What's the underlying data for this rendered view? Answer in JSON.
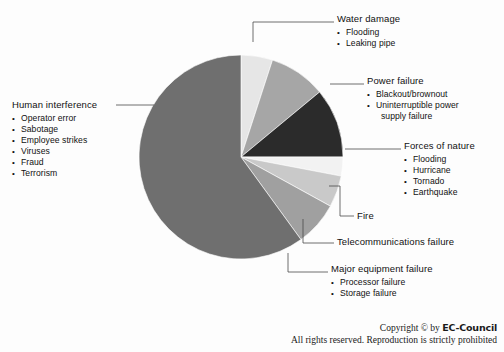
{
  "chart_data": {
    "type": "pie",
    "title": "",
    "legend_position": "callouts",
    "categories": [
      "Water damage",
      "Power failure",
      "Forces of nature",
      "Fire",
      "Telecommunications failure",
      "Major equipment failure",
      "Human interference"
    ],
    "values": [
      5,
      9,
      11,
      3,
      5,
      7,
      60
    ],
    "unit": "percent",
    "colors": [
      "#e6e6e6",
      "#a6a6a6",
      "#2b2b2b",
      "#f2f2f2",
      "#c9c9c9",
      "#a0a0a0",
      "#6f6f6f"
    ],
    "start_angle_deg": 0,
    "direction": "clockwise",
    "grid": false
  },
  "callouts": [
    {
      "id": "water-damage",
      "title": "Water damage",
      "items": [
        "Flooding",
        "Leaking pipe"
      ]
    },
    {
      "id": "power-failure",
      "title": "Power failure",
      "items": [
        "Blackout/brownout",
        "Uninterruptible power",
        "supply failure"
      ]
    },
    {
      "id": "forces-of-nature",
      "title": "Forces of nature",
      "items": [
        "Flooding",
        "Hurricane",
        "Tornado",
        "Earthquake"
      ]
    },
    {
      "id": "fire",
      "title": "Fire",
      "items": []
    },
    {
      "id": "telecommunications-failure",
      "title": "Telecommunications failure",
      "items": []
    },
    {
      "id": "major-equipment-failure",
      "title": "Major equipment failure",
      "items": [
        "Processor failure",
        "Storage failure"
      ]
    },
    {
      "id": "human-interference",
      "title": "Human interference",
      "items": [
        "Operator error",
        "Sabotage",
        "Employee strikes",
        "Viruses",
        "Fraud",
        "Terrorism"
      ]
    }
  ],
  "footer": {
    "copyright_prefix": "Copyright © by ",
    "brand": "EC-Council",
    "rights": "All rights reserved. Reproduction is strictly prohibited"
  }
}
